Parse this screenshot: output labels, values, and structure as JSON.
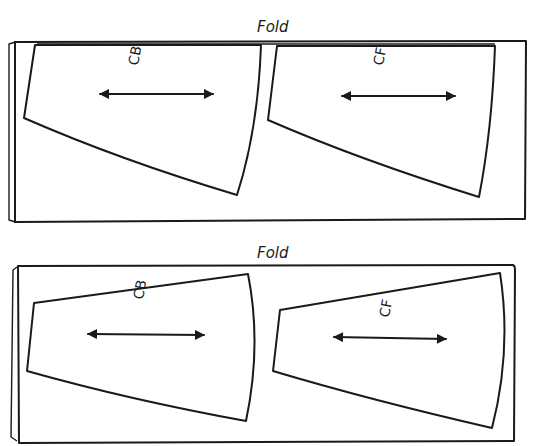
{
  "diagrams": [
    {
      "fold_label": "Fold",
      "pieces": [
        {
          "label": "CB",
          "grainline": "double-arrow-horizontal"
        },
        {
          "label": "CF",
          "grainline": "double-arrow-horizontal"
        }
      ]
    },
    {
      "fold_label": "Fold",
      "pieces": [
        {
          "label": "CB",
          "grainline": "double-arrow-horizontal"
        },
        {
          "label": "CF",
          "grainline": "double-arrow-horizontal"
        }
      ]
    }
  ],
  "colors": {
    "ink": "#1a1a1a",
    "paper": "#ffffff"
  }
}
